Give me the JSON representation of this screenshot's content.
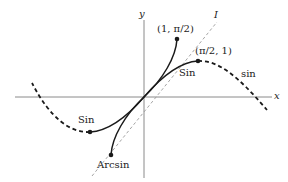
{
  "diagram": {
    "axes": {
      "x_label": "x",
      "y_label": "y"
    },
    "identity_line_label": "I",
    "points": {
      "upper_arcsin_end": "(1, π/2)",
      "upper_sin_end": "(π/2, 1)"
    },
    "curve_labels": {
      "sin_restricted_upper": "Sin",
      "sin_restricted_lower": "Sin",
      "sin_full": "sin",
      "arcsin": "Arcsin"
    },
    "colors": {
      "curve": "#1a1a1a",
      "axis": "#8a8a8a",
      "identity": "#9a9a9a",
      "background": "#ffffff"
    }
  }
}
